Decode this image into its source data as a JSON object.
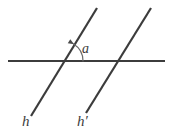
{
  "figure": {
    "background_color": "#ffffff",
    "stroke_color": "#3c3c3c",
    "arc_color": "#6b6b6b",
    "width": 172,
    "height": 136,
    "labels": {
      "line_h": "h",
      "line_h_prime": "h′",
      "angle": "a"
    },
    "lines": [
      {
        "name": "horizontal-line",
        "x1": 8,
        "y1": 61,
        "x2": 165,
        "y2": 61,
        "stroke_width": 2.2
      },
      {
        "name": "line-h",
        "x1": 31,
        "y1": 116,
        "x2": 97,
        "y2": 8,
        "stroke_width": 2.2
      },
      {
        "name": "line-h-prime",
        "x1": 86,
        "y1": 113,
        "x2": 151,
        "y2": 8,
        "stroke_width": 2.2
      }
    ],
    "intersections": [
      {
        "name": "intersection-h",
        "x": 63,
        "y": 61
      },
      {
        "name": "intersection-h-prime",
        "x": 118,
        "y": 61
      }
    ],
    "angle_arc": {
      "name": "angle-arc-a",
      "center_x": 63,
      "center_y": 61,
      "radius": 20,
      "start_deg": 0,
      "end_deg": 58,
      "stroke_width": 1.2,
      "arrow": true
    },
    "label_positions": {
      "line_h": {
        "x": 22,
        "y": 126
      },
      "line_h_prime": {
        "x": 77,
        "y": 126
      },
      "angle": {
        "x": 82,
        "y": 53
      }
    }
  }
}
